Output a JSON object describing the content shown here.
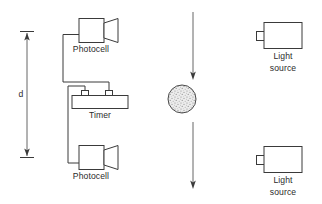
{
  "diagram": {
    "canvas": {
      "width": 322,
      "height": 204,
      "background": "#ffffff"
    },
    "stroke_color": "#3a3a3a",
    "fill_color": "#ffffff",
    "ball_fill": "#e8e8e8",
    "labels": {
      "distance": "d",
      "photocell_top": "Photocell",
      "photocell_bottom": "Photocell",
      "timer": "Timer",
      "light_source_top_line1": "Light",
      "light_source_top_line2": "source",
      "light_source_bottom_line1": "Light",
      "light_source_bottom_line2": "source"
    },
    "components": [
      {
        "name": "distance-arrow",
        "kind": "double-headed-arrow",
        "label": "d",
        "x": 27,
        "y_top": 31,
        "y_bottom": 157
      },
      {
        "name": "photocell-top",
        "kind": "photocell",
        "x": 79,
        "y": 18,
        "width": 26,
        "height": 24
      },
      {
        "name": "timer",
        "kind": "timer",
        "x": 72,
        "y": 95,
        "width": 56,
        "height": 13
      },
      {
        "name": "photocell-bottom",
        "kind": "photocell",
        "x": 79,
        "y": 145,
        "width": 26,
        "height": 24
      },
      {
        "name": "falling-ball",
        "kind": "sphere",
        "cx": 182,
        "cy": 99,
        "r": 14
      },
      {
        "name": "motion-arrow-top",
        "kind": "arrow-down",
        "x": 193,
        "y_start": 12,
        "y_end": 78
      },
      {
        "name": "motion-arrow-bottom",
        "kind": "arrow-down",
        "x": 193,
        "y_start": 120,
        "y_end": 188
      },
      {
        "name": "light-source-top",
        "kind": "light-source",
        "x": 263,
        "y": 22,
        "width": 40,
        "height": 26
      },
      {
        "name": "light-source-bottom",
        "kind": "light-source",
        "x": 263,
        "y": 146,
        "width": 40,
        "height": 26
      }
    ],
    "wiring": [
      {
        "name": "wire-top-photocell-to-timer",
        "from": "photocell-top",
        "to": "timer"
      },
      {
        "name": "wire-bottom-photocell-to-timer",
        "from": "photocell-bottom",
        "to": "timer"
      }
    ]
  }
}
